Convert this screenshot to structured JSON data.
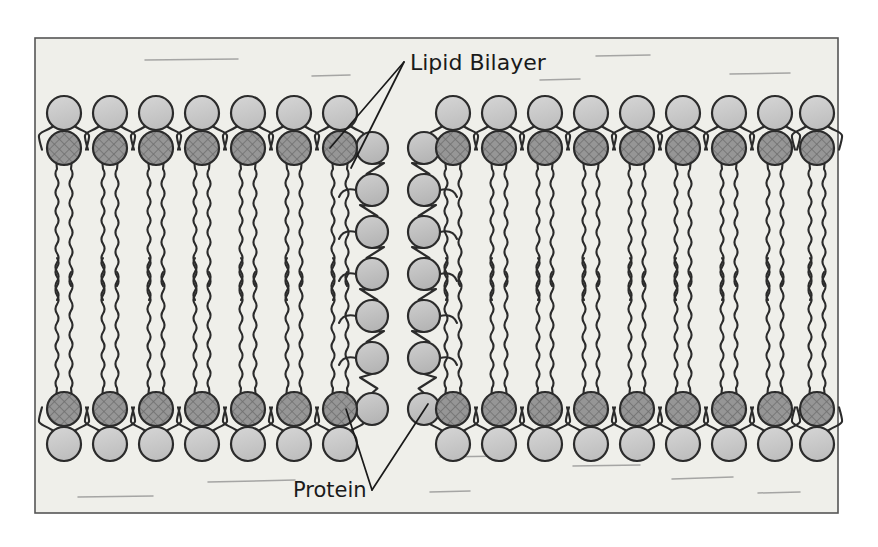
{
  "figure": {
    "title_alt": "Lipid Bilayer with embedded Protein channel",
    "background_color": "#ffffff",
    "panel_color": "#efefea",
    "border_color": "#555555",
    "panel": {
      "x": 35,
      "y": 38,
      "width": 803,
      "height": 475
    }
  },
  "labels": [
    {
      "name": "lipid-bilayer",
      "text": "Lipid Bilayer",
      "x": 410,
      "y": 70,
      "font_size": 22,
      "color": "#1a1a1a"
    },
    {
      "name": "protein",
      "text": "Protein",
      "x": 293,
      "y": 497,
      "font_size": 21,
      "color": "#1a1a1a"
    }
  ],
  "leader_lines": [
    {
      "name": "lipid-bilayer-leader-1",
      "x1": 404,
      "y1": 62,
      "x2": 330,
      "y2": 148
    },
    {
      "name": "lipid-bilayer-leader-2",
      "x1": 404,
      "y1": 62,
      "x2": 351,
      "y2": 168
    },
    {
      "name": "protein-leader-1",
      "x1": 372,
      "y1": 490,
      "x2": 346,
      "y2": 409
    },
    {
      "name": "protein-leader-2",
      "x1": 372,
      "y1": 490,
      "x2": 428,
      "y2": 404
    }
  ],
  "colors": {
    "head_outer": "#c9c9c9",
    "head_inner": "#969696",
    "protein_bead": "#c2c2c2",
    "stroke": "#2b2b2b",
    "tail": "#2b2b2b",
    "hatch": "#6f6f6f"
  },
  "geometry": {
    "outer_head_radius": 17,
    "inner_head_radius": 17,
    "protein_bead_radius": 16,
    "top_outer_cy": 113,
    "top_inner_cy": 148,
    "bottom_inner_cy": 409,
    "bottom_outer_cy": 444,
    "tail_top_y": 165,
    "tail_top_end_y": 300,
    "tail_bottom_y": 392,
    "tail_bottom_end_y": 258
  },
  "lipids": {
    "left_group": {
      "name": "left-leaflet-group",
      "count": 7,
      "x_positions": [
        64,
        110,
        156,
        202,
        248,
        294,
        340
      ]
    },
    "right_group": {
      "name": "right-leaflet-group",
      "count": 9,
      "x_positions": [
        453,
        499,
        545,
        591,
        637,
        683,
        729,
        775,
        817
      ]
    }
  },
  "protein": {
    "name": "protein-channel",
    "columns": [
      {
        "name": "protein-column-left",
        "cx": 372,
        "beads_cy": [
          148,
          190,
          232,
          274,
          316,
          358,
          409
        ]
      },
      {
        "name": "protein-column-right",
        "cx": 424,
        "beads_cy": [
          148,
          190,
          232,
          274,
          316,
          358,
          409
        ]
      }
    ],
    "bead_count_per_column": 7
  },
  "artifacts": [
    {
      "name": "smudge-1",
      "x1": 145,
      "y1": 60,
      "x2": 238,
      "y2": 59
    },
    {
      "name": "smudge-2",
      "x1": 312,
      "y1": 76,
      "x2": 350,
      "y2": 75
    },
    {
      "name": "smudge-3",
      "x1": 596,
      "y1": 56,
      "x2": 650,
      "y2": 55
    },
    {
      "name": "smudge-4",
      "x1": 730,
      "y1": 74,
      "x2": 790,
      "y2": 73
    },
    {
      "name": "smudge-5",
      "x1": 540,
      "y1": 80,
      "x2": 580,
      "y2": 79
    },
    {
      "name": "smudge-6",
      "x1": 208,
      "y1": 482,
      "x2": 295,
      "y2": 480
    },
    {
      "name": "smudge-7",
      "x1": 573,
      "y1": 466,
      "x2": 640,
      "y2": 465
    },
    {
      "name": "smudge-8",
      "x1": 672,
      "y1": 479,
      "x2": 733,
      "y2": 477
    },
    {
      "name": "smudge-9",
      "x1": 78,
      "y1": 497,
      "x2": 153,
      "y2": 496
    },
    {
      "name": "smudge-10",
      "x1": 430,
      "y1": 492,
      "x2": 470,
      "y2": 491
    },
    {
      "name": "smudge-11",
      "x1": 758,
      "y1": 493,
      "x2": 800,
      "y2": 492
    },
    {
      "name": "smudge-12",
      "x1": 440,
      "y1": 457,
      "x2": 505,
      "y2": 456
    }
  ]
}
